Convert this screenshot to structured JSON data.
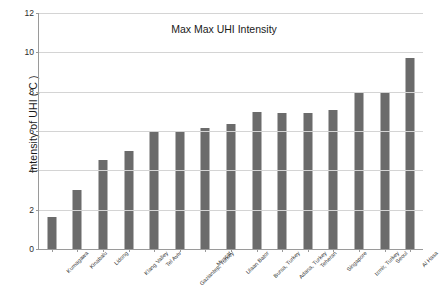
{
  "chart_data": {
    "type": "bar",
    "title": "Max Max UHI Intensity",
    "xlabel": "",
    "ylabel": "Intensity of UHI  ( C )",
    "ylim": [
      0,
      12
    ],
    "yticks": [
      0,
      2,
      4,
      6,
      8,
      10,
      12
    ],
    "grid": true,
    "legend": false,
    "bar_color": "#6b6b6b",
    "gridline_color": "#d4d4d4",
    "axis_color": "#9a9a9a",
    "categories": [
      "Kumagawa",
      "Kinabalu",
      "Lidong",
      "Klang Valley",
      "Tel Aviv",
      "Gaziantep, Turkey",
      "Muscat",
      "Ulaan Bator",
      "Bursa, Turkey",
      "Adana, Turkey",
      "Teheran",
      "Singapore",
      "Izmir, Turkey",
      "Seoul",
      "Al Hasa"
    ],
    "values": [
      1.65,
      3.0,
      4.55,
      4.97,
      5.97,
      5.97,
      6.15,
      6.35,
      6.95,
      6.93,
      6.93,
      7.05,
      7.93,
      7.93,
      9.7
    ]
  }
}
